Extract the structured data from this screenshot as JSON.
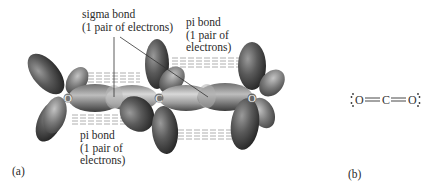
{
  "figure": {
    "panel_a": {
      "label": "(a)",
      "atoms": [
        {
          "symbol": "O",
          "x": 68,
          "y": 98
        },
        {
          "symbol": "C",
          "x": 159,
          "y": 98
        },
        {
          "symbol": "O",
          "x": 252,
          "y": 98
        }
      ],
      "annotations": {
        "sigma": {
          "line1": "sigma bond",
          "line2": "(1 pair of electrons)"
        },
        "pi_top": {
          "line1": "pi bond",
          "line2": "(1 pair of",
          "line3": "electrons)"
        },
        "pi_bottom": {
          "line1": "pi bond",
          "line2": "(1 pair of",
          "line3": "electrons)"
        }
      }
    },
    "panel_b": {
      "label": "(b)",
      "lewis": {
        "left_atom": "O",
        "bond1": "=",
        "center_atom": "C",
        "bond2": "=",
        "right_atom": "O"
      }
    }
  }
}
